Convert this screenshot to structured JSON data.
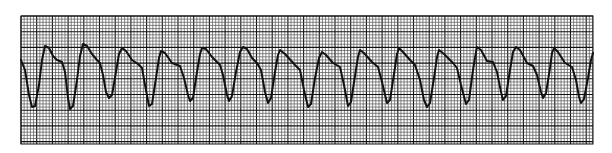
{
  "strip": {
    "background": "#ffffff",
    "paper_color": "#ffffff",
    "grid_color_minor": "#555555",
    "grid_color_major": "#111111",
    "trace_color": "#111111",
    "grid_box": {
      "x": 21,
      "y": 16,
      "width": 572,
      "height": 128
    },
    "minor_spacing": 3.14,
    "major_every": 5
  },
  "chart_data": {
    "type": "line",
    "title": "",
    "xlabel": "",
    "ylabel": "",
    "grid": true,
    "beat_count": 15,
    "points": [
      [
        21,
        60
      ],
      [
        25,
        70
      ],
      [
        29,
        95
      ],
      [
        32,
        107
      ],
      [
        35,
        106
      ],
      [
        39,
        85
      ],
      [
        42,
        60
      ],
      [
        45,
        46
      ],
      [
        49,
        48
      ],
      [
        53,
        56
      ],
      [
        57,
        60
      ],
      [
        62,
        62
      ],
      [
        65,
        72
      ],
      [
        68,
        98
      ],
      [
        70,
        109
      ],
      [
        73,
        106
      ],
      [
        77,
        80
      ],
      [
        80,
        56
      ],
      [
        83,
        44
      ],
      [
        87,
        46
      ],
      [
        92,
        54
      ],
      [
        97,
        60
      ],
      [
        100,
        63
      ],
      [
        103,
        75
      ],
      [
        106,
        92
      ],
      [
        109,
        98
      ],
      [
        112,
        95
      ],
      [
        116,
        72
      ],
      [
        119,
        54
      ],
      [
        122,
        48
      ],
      [
        126,
        51
      ],
      [
        132,
        60
      ],
      [
        138,
        64
      ],
      [
        142,
        68
      ],
      [
        145,
        85
      ],
      [
        149,
        106
      ],
      [
        152,
        104
      ],
      [
        156,
        78
      ],
      [
        159,
        58
      ],
      [
        161,
        51
      ],
      [
        165,
        53
      ],
      [
        172,
        63
      ],
      [
        180,
        66
      ],
      [
        184,
        78
      ],
      [
        188,
        95
      ],
      [
        190,
        101
      ],
      [
        193,
        98
      ],
      [
        197,
        72
      ],
      [
        200,
        54
      ],
      [
        202,
        48
      ],
      [
        206,
        49
      ],
      [
        212,
        57
      ],
      [
        220,
        65
      ],
      [
        223,
        75
      ],
      [
        227,
        95
      ],
      [
        229,
        101
      ],
      [
        232,
        96
      ],
      [
        236,
        72
      ],
      [
        240,
        52
      ],
      [
        243,
        47
      ],
      [
        247,
        49
      ],
      [
        252,
        58
      ],
      [
        257,
        63
      ],
      [
        261,
        70
      ],
      [
        265,
        92
      ],
      [
        268,
        103
      ],
      [
        271,
        98
      ],
      [
        275,
        72
      ],
      [
        278,
        55
      ],
      [
        280,
        50
      ],
      [
        285,
        54
      ],
      [
        295,
        65
      ],
      [
        300,
        70
      ],
      [
        304,
        90
      ],
      [
        308,
        107
      ],
      [
        311,
        104
      ],
      [
        315,
        78
      ],
      [
        319,
        58
      ],
      [
        322,
        52
      ],
      [
        326,
        55
      ],
      [
        333,
        63
      ],
      [
        340,
        67
      ],
      [
        344,
        85
      ],
      [
        348,
        106
      ],
      [
        351,
        102
      ],
      [
        355,
        76
      ],
      [
        358,
        57
      ],
      [
        360,
        50
      ],
      [
        364,
        53
      ],
      [
        372,
        62
      ],
      [
        378,
        67
      ],
      [
        382,
        82
      ],
      [
        387,
        103
      ],
      [
        390,
        100
      ],
      [
        394,
        74
      ],
      [
        397,
        54
      ],
      [
        399,
        48
      ],
      [
        403,
        52
      ],
      [
        410,
        60
      ],
      [
        415,
        65
      ],
      [
        420,
        80
      ],
      [
        424,
        100
      ],
      [
        427,
        107
      ],
      [
        430,
        103
      ],
      [
        434,
        78
      ],
      [
        437,
        57
      ],
      [
        439,
        50
      ],
      [
        444,
        54
      ],
      [
        453,
        63
      ],
      [
        457,
        68
      ],
      [
        461,
        85
      ],
      [
        466,
        104
      ],
      [
        469,
        100
      ],
      [
        473,
        70
      ],
      [
        476,
        52
      ],
      [
        477,
        47
      ],
      [
        481,
        50
      ],
      [
        487,
        61
      ],
      [
        493,
        62
      ],
      [
        497,
        72
      ],
      [
        501,
        92
      ],
      [
        503,
        100
      ],
      [
        506,
        96
      ],
      [
        510,
        70
      ],
      [
        513,
        52
      ],
      [
        516,
        47
      ],
      [
        520,
        50
      ],
      [
        527,
        63
      ],
      [
        533,
        66
      ],
      [
        537,
        75
      ],
      [
        541,
        92
      ],
      [
        543,
        98
      ],
      [
        546,
        93
      ],
      [
        550,
        68
      ],
      [
        552,
        53
      ],
      [
        554,
        48
      ],
      [
        558,
        52
      ],
      [
        565,
        63
      ],
      [
        572,
        67
      ],
      [
        576,
        80
      ],
      [
        579,
        97
      ],
      [
        581,
        103
      ],
      [
        584,
        99
      ],
      [
        588,
        78
      ],
      [
        591,
        60
      ],
      [
        593,
        53
      ]
    ]
  }
}
